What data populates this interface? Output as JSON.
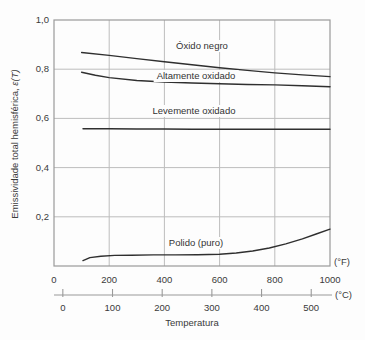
{
  "colors": {
    "background": "#fdfdfd",
    "grid": "#bdbdbd",
    "frame": "#9a9a9a",
    "curve": "#2f2f2f",
    "text": "#3a3a3a"
  },
  "chart_data": {
    "type": "line",
    "title": "",
    "xlabel": "Temperatura",
    "ylabel": "Emissividade total hemisférica, ε(T)",
    "ylabel_main": "Emissividade total hemisférica, ",
    "ylabel_symbol": "ε(T)",
    "grid": true,
    "legend_position": "inline-labels",
    "f_axis": {
      "unit_label": "(°F)",
      "range": [
        0,
        1000
      ],
      "ticks": [
        0,
        200,
        400,
        600,
        800,
        1000
      ]
    },
    "c_axis": {
      "unit_label": "(°C)",
      "ticks": [
        0,
        100,
        200,
        300,
        400,
        500
      ]
    },
    "y_axis": {
      "range": [
        0,
        1.0
      ],
      "tick_values": [
        1.0,
        0.8,
        0.6,
        0.4,
        0.2
      ],
      "tick_labels": [
        "1,0",
        "0,8",
        "0,6",
        "0,4",
        "0,2"
      ]
    },
    "series": [
      {
        "name": "Óxido negro",
        "label_xy": [
          202,
          46
        ],
        "points_f_emissivity": [
          [
            100,
            0.868
          ],
          [
            200,
            0.856
          ],
          [
            300,
            0.843
          ],
          [
            400,
            0.83
          ],
          [
            500,
            0.818
          ],
          [
            600,
            0.806
          ],
          [
            700,
            0.795
          ],
          [
            800,
            0.785
          ],
          [
            900,
            0.777
          ],
          [
            1000,
            0.77
          ]
        ]
      },
      {
        "name": "Altamente oxidado",
        "label_xy": [
          196,
          76
        ],
        "points_f_emissivity": [
          [
            100,
            0.788
          ],
          [
            150,
            0.775
          ],
          [
            200,
            0.766
          ],
          [
            300,
            0.754
          ],
          [
            400,
            0.748
          ],
          [
            500,
            0.744
          ],
          [
            600,
            0.741
          ],
          [
            700,
            0.738
          ],
          [
            800,
            0.736
          ],
          [
            900,
            0.733
          ],
          [
            1000,
            0.729
          ]
        ]
      },
      {
        "name": "Levemente oxidado",
        "label_xy": [
          194,
          111
        ],
        "points_f_emissivity": [
          [
            105,
            0.558
          ],
          [
            200,
            0.558
          ],
          [
            300,
            0.557
          ],
          [
            400,
            0.557
          ],
          [
            500,
            0.556
          ],
          [
            600,
            0.556
          ],
          [
            700,
            0.556
          ],
          [
            800,
            0.556
          ],
          [
            900,
            0.556
          ],
          [
            1000,
            0.556
          ]
        ]
      },
      {
        "name": "Polido (puro)",
        "label_xy": [
          196,
          243
        ],
        "points_f_emissivity": [
          [
            105,
            0.022
          ],
          [
            130,
            0.034
          ],
          [
            170,
            0.04
          ],
          [
            220,
            0.043
          ],
          [
            280,
            0.044
          ],
          [
            360,
            0.045
          ],
          [
            440,
            0.045
          ],
          [
            520,
            0.046
          ],
          [
            600,
            0.048
          ],
          [
            660,
            0.053
          ],
          [
            720,
            0.061
          ],
          [
            780,
            0.073
          ],
          [
            840,
            0.09
          ],
          [
            900,
            0.11
          ],
          [
            950,
            0.13
          ],
          [
            1000,
            0.15
          ]
        ]
      }
    ]
  }
}
